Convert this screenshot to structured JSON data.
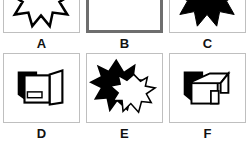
{
  "question_panel": {
    "type": "multiple-choice-image-options",
    "columns": 3,
    "rows": 2,
    "selected_option": "B",
    "selected_border_color": "#6e6e6e",
    "panel_border_color": "#bfbfbf",
    "background_color": "#ffffff",
    "shape_fill_black": "#000000",
    "shape_fill_white": "#ffffff",
    "options": [
      {
        "id": "A",
        "label": "A",
        "selected": false,
        "figure_name": "outlined-starburst",
        "figure_description": "white eight-point starburst with black outline, partially cropped at top"
      },
      {
        "id": "B",
        "label": "B",
        "selected": true,
        "figure_name": "outlined-box-with-flap",
        "figure_description": "white rectangular box with open flap outline, partially cropped at top"
      },
      {
        "id": "C",
        "label": "C",
        "selected": false,
        "figure_name": "filled-starburst",
        "figure_description": "solid black eight-point starburst, partially cropped at top"
      },
      {
        "id": "D",
        "label": "D",
        "selected": false,
        "figure_name": "box-with-open-flap-and-shadow",
        "figure_description": "white box with small rectangle inside, open flap on right and solid black shadow behind on the left"
      },
      {
        "id": "E",
        "label": "E",
        "selected": false,
        "figure_name": "overlapping-starbursts",
        "figure_description": "large solid black eight-point starburst overlapped by a smaller white outlined starburst in front at lower right"
      },
      {
        "id": "F",
        "label": "F",
        "selected": false,
        "figure_name": "house-with-shadow",
        "figure_description": "white house with pitched roof and door, solid black shadow offset behind to the left"
      }
    ]
  }
}
